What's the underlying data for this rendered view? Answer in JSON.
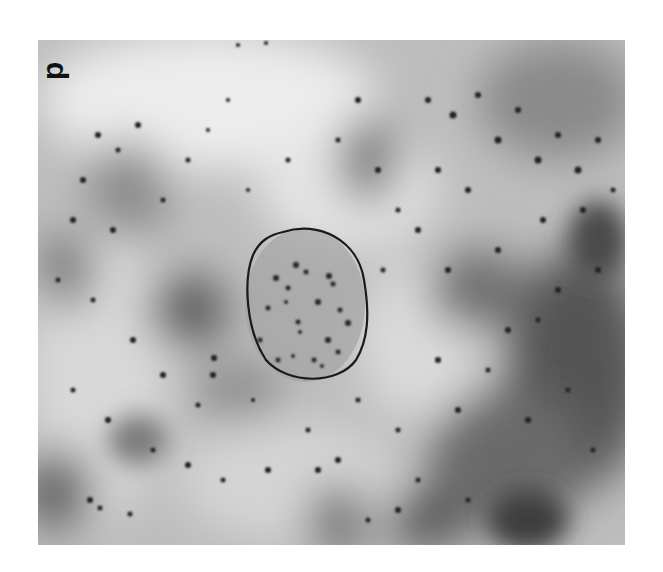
{
  "figure": {
    "panel_label": "d",
    "outlined_region": {
      "shape": "oval",
      "cx": 305,
      "cy": 305,
      "rx": 62,
      "ry": 78
    },
    "colors": {
      "background_light": "#e2e2e2",
      "background_mid": "#9a9a9a",
      "background_dark": "#3c3c3c",
      "outline": "#1a1a1a",
      "particles": "#222222"
    }
  }
}
